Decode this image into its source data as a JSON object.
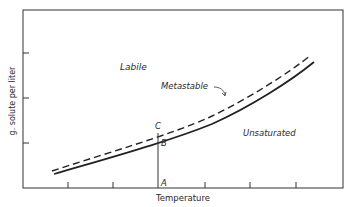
{
  "diagram": {
    "title": "",
    "xlabel": "Temperature",
    "ylabel": "g. solute per liter",
    "regions": {
      "labile": "Labile",
      "metastable": "Metastable",
      "unsaturated": "Unsaturated"
    },
    "points": {
      "A": "A",
      "B": "B",
      "C": "C"
    },
    "curves": [
      {
        "name": "supersolubility",
        "style": "dashed"
      },
      {
        "name": "solubility",
        "style": "solid"
      }
    ],
    "ink_color": "#2a2a2a"
  }
}
